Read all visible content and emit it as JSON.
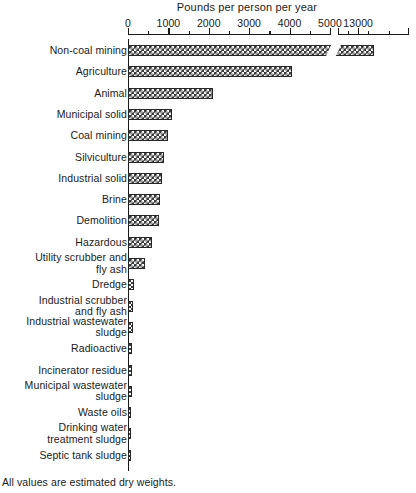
{
  "chart_data": {
    "type": "bar",
    "orientation": "horizontal",
    "title": "Pounds per person per year",
    "xlabel": "Pounds per person per year",
    "ylabel": "",
    "footnote": "All values are estimated dry weights.",
    "axis_break": true,
    "axis_break_note": "Axis is broken between 5000 and 13000",
    "xlim": [
      0,
      5000
    ],
    "grid": false,
    "legend": "none",
    "tick_labels": [
      "0",
      "1000",
      "2000",
      "3000",
      "4000",
      "5000",
      "13000"
    ],
    "tick_values": [
      0,
      1000,
      2000,
      3000,
      4000,
      5000,
      13000
    ],
    "minor_tick_interval": 500,
    "categories": [
      "Non-coal mining",
      "Agriculture",
      "Animal",
      "Municipal solid",
      "Coal mining",
      "Silviculture",
      "Industrial solid",
      "Brine",
      "Demolition",
      "Hazardous",
      "Utility scrubber and\nfly ash",
      "Dredge",
      "Industrial scrubber\nand fly ash",
      "Industrial wastewater\nsludge",
      "Radioactive",
      "Incinerator residue",
      "Municipal wastewater\nsludge",
      "Waste oils",
      "Drinking water\ntreatment sludge",
      "Septic tank sludge"
    ],
    "values": [
      13400,
      4060,
      2100,
      1080,
      980,
      900,
      830,
      800,
      770,
      590,
      430,
      160,
      130,
      120,
      110,
      100,
      90,
      80,
      70,
      20
    ]
  }
}
